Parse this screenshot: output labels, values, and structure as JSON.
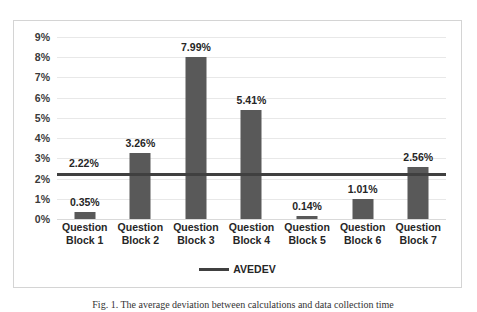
{
  "chart_data": {
    "type": "bar",
    "title": "",
    "xlabel": "",
    "ylabel": "",
    "categories": [
      "Question Block 1",
      "Question Block 2",
      "Question Block 3",
      "Question Block 4",
      "Question Block 5",
      "Question Block 6",
      "Question Block 7"
    ],
    "category_lines": [
      [
        "Question",
        "Block 1"
      ],
      [
        "Question",
        "Block 2"
      ],
      [
        "Question",
        "Block 3"
      ],
      [
        "Question",
        "Block 4"
      ],
      [
        "Question",
        "Block 5"
      ],
      [
        "Question",
        "Block 6"
      ],
      [
        "Question",
        "Block 7"
      ]
    ],
    "values": [
      0.35,
      3.26,
      7.99,
      5.41,
      0.14,
      1.01,
      2.56
    ],
    "value_labels": [
      "0.35%",
      "3.26%",
      "7.99%",
      "5.41%",
      "0.14%",
      "1.01%",
      "2.56%"
    ],
    "series": [
      {
        "name": "Bars",
        "type": "bar",
        "color": "#595959",
        "values": [
          0.35,
          3.26,
          7.99,
          5.41,
          0.14,
          1.01,
          2.56
        ]
      },
      {
        "name": "AVEDEV",
        "type": "line",
        "color": "#404040",
        "constant_value": 2.22,
        "label": "2.22%"
      }
    ],
    "ylim": [
      0,
      9
    ],
    "yticks": [
      0,
      1,
      2,
      3,
      4,
      5,
      6,
      7,
      8,
      9
    ],
    "ytick_labels": [
      "0%",
      "1%",
      "2%",
      "3%",
      "4%",
      "5%",
      "6%",
      "7%",
      "8%",
      "9%"
    ],
    "grid": true,
    "legend": {
      "position": "bottom",
      "entries": [
        {
          "label": "AVEDEV",
          "marker": "line",
          "color": "#404040"
        }
      ]
    }
  },
  "legend": {
    "avedev_label": "AVEDEV"
  },
  "caption": {
    "text": "Fig. 1. The average deviation between calculations and data collection time"
  },
  "colors": {
    "bar": "#595959",
    "avedev_line": "#404040",
    "gridline": "#e8e8e8",
    "frame_border": "#d4d4d4",
    "text": "#262626"
  }
}
